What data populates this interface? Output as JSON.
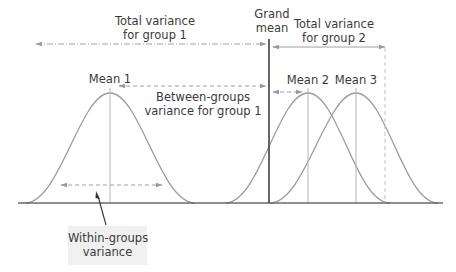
{
  "labels": {
    "total_variance_group1": [
      "Total variance",
      "for group 1"
    ],
    "grand_mean": [
      "Grand",
      "mean"
    ],
    "total_variance_group2": [
      "Total variance",
      "for group 2"
    ],
    "mean1": "Mean 1",
    "mean2": "Mean 2",
    "mean3": "Mean 3",
    "between_groups": [
      "Between-groups",
      "variance for group 1"
    ],
    "within_groups": [
      "Within-groups",
      "variance"
    ]
  },
  "colors": {
    "curve": "#9a9a9a",
    "baseline": "#6a6a6a",
    "grand_mean_line": "#555555",
    "mean_lines": "#b5b5b5",
    "arrow": "#a0a0a0",
    "text": "#3a3a3a",
    "label_box": "#f0f0f0"
  },
  "curves": [
    {
      "name": "group 1",
      "mean_x": 110,
      "peak_y": 93
    },
    {
      "name": "group 2",
      "mean_x": 308,
      "peak_y": 93
    },
    {
      "name": "group 3",
      "mean_x": 356,
      "peak_y": 93
    }
  ]
}
